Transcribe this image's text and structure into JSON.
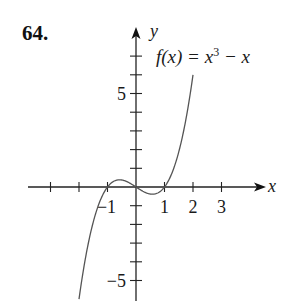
{
  "problem_number": "64.",
  "chart_data": {
    "type": "line",
    "title": "",
    "function_label": "f(x) = x^3 - x",
    "function_parts": {
      "lhs": "f(x) = x",
      "exp": "3",
      "rhs": " − x"
    },
    "xlabel": "x",
    "ylabel": "y",
    "xlim": [
      -3.2,
      4.6
    ],
    "ylim": [
      -6.1,
      8.4
    ],
    "x_ticks": [
      -3,
      -2,
      -1,
      0,
      1,
      2,
      3
    ],
    "x_tick_labels": [
      {
        "value": -1,
        "text": "−1"
      },
      {
        "value": 1,
        "text": "1"
      },
      {
        "value": 2,
        "text": "2"
      },
      {
        "value": 3,
        "text": "3"
      }
    ],
    "y_ticks": [
      -5,
      -4,
      -3,
      -2,
      -1,
      0,
      1,
      2,
      3,
      4,
      5,
      6,
      7
    ],
    "y_tick_labels": [
      {
        "value": 5,
        "text": "5"
      },
      {
        "value": -5,
        "text": "−5"
      }
    ],
    "grid": false,
    "series": [
      {
        "name": "f(x) = x^3 - x",
        "x": [
          -2.0,
          -1.75,
          -1.5,
          -1.25,
          -1.0,
          -0.75,
          -0.577,
          -0.25,
          0.0,
          0.25,
          0.577,
          0.75,
          1.0,
          1.25,
          1.5,
          1.75,
          2.0
        ],
        "y": [
          -6.0,
          -3.61,
          -1.875,
          -0.703,
          0.0,
          0.328,
          0.385,
          0.234,
          0.0,
          -0.234,
          -0.385,
          -0.328,
          0.0,
          0.703,
          1.875,
          3.61,
          6.0
        ]
      }
    ]
  }
}
